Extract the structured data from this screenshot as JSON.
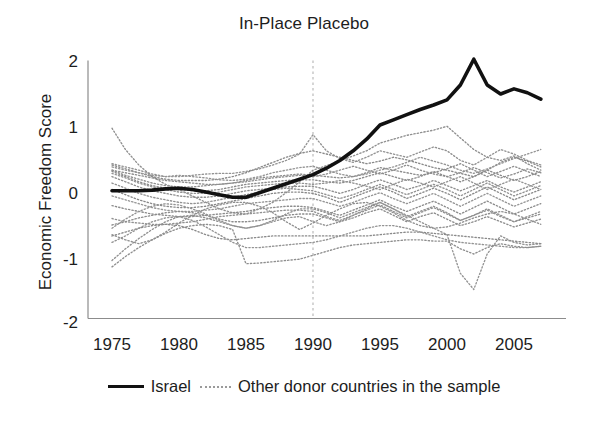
{
  "figure": {
    "title": "In-Place Placebo",
    "background": "#ffffff",
    "width": 608,
    "height": 425
  },
  "axes": {
    "ylabel": "Economic Freedom Score",
    "xlabel": "",
    "yticks": [
      "2",
      "1",
      "0",
      "-1",
      "-2"
    ],
    "xticks": [
      "1975",
      "1980",
      "1985",
      "1990",
      "1995",
      "2000",
      "2005"
    ],
    "axis_color": "#8c8c8c"
  },
  "legend": {
    "items": [
      {
        "label": "Israel",
        "style": "solid",
        "color": "#111111",
        "icon": "solid-line-icon"
      },
      {
        "label": "Other donor countries in the sample",
        "style": "dotted",
        "color": "#9a9a9a",
        "icon": "dotted-line-icon"
      }
    ]
  },
  "annotations": {
    "treatment_year_line": {
      "name": "treatment-year-marker",
      "x": 1990,
      "style": "dashed",
      "color": "#b4b4b4"
    }
  },
  "chart_data": {
    "type": "line",
    "title": "In-Place Placebo",
    "xlabel": "",
    "ylabel": "Economic Freedom Score",
    "xlim": [
      1975,
      2007
    ],
    "ylim": [
      -2,
      2
    ],
    "xticks": [
      1975,
      1980,
      1985,
      1990,
      1995,
      2000,
      2005
    ],
    "yticks": [
      -2,
      -1,
      0,
      1,
      2
    ],
    "grid": false,
    "legend_position": "below-axis",
    "vline_x": 1990,
    "x": [
      1975,
      1976,
      1977,
      1978,
      1979,
      1980,
      1981,
      1982,
      1983,
      1984,
      1985,
      1986,
      1987,
      1988,
      1989,
      1990,
      1991,
      1992,
      1993,
      1994,
      1995,
      1996,
      1997,
      1998,
      1999,
      2000,
      2001,
      2002,
      2003,
      2004,
      2005,
      2006,
      2007
    ],
    "series": [
      {
        "name": "Israel",
        "style": "solid",
        "color": "#111111",
        "width": 3.6,
        "values": [
          -0.02,
          -0.02,
          -0.02,
          -0.01,
          0.01,
          0.02,
          0.0,
          -0.04,
          -0.08,
          -0.12,
          -0.12,
          -0.05,
          0.02,
          0.09,
          0.16,
          0.23,
          0.33,
          0.45,
          0.6,
          0.78,
          1.0,
          1.08,
          1.16,
          1.24,
          1.31,
          1.39,
          1.62,
          2.02,
          1.62,
          1.48,
          1.56,
          1.5,
          1.4
        ]
      },
      {
        "name": "donor-1",
        "style": "dotted",
        "color": "#8f8f8f",
        "values": [
          0.95,
          0.62,
          0.38,
          0.2,
          0.08,
          0.0,
          -0.1,
          -0.2,
          -0.3,
          -0.36,
          -0.38,
          -0.3,
          -0.2,
          -0.05,
          0.12,
          0.3,
          0.37,
          0.45,
          0.52,
          0.6,
          0.72,
          0.78,
          0.84,
          0.88,
          0.92,
          0.98,
          0.8,
          0.62,
          0.5,
          0.45,
          0.52,
          0.4,
          0.3
        ]
      },
      {
        "name": "donor-2",
        "style": "dotted",
        "color": "#939393",
        "values": [
          0.4,
          0.35,
          0.3,
          0.24,
          0.2,
          0.2,
          0.22,
          0.24,
          0.25,
          0.25,
          0.28,
          0.32,
          0.38,
          0.45,
          0.55,
          0.85,
          0.6,
          0.48,
          0.42,
          0.5,
          0.6,
          0.55,
          0.5,
          0.58,
          0.66,
          0.6,
          0.45,
          0.38,
          0.5,
          0.62,
          0.55,
          0.45,
          0.38
        ]
      },
      {
        "name": "donor-3",
        "style": "dotted",
        "color": "#8a8a8a",
        "values": [
          0.38,
          0.32,
          0.26,
          0.2,
          0.16,
          0.14,
          0.14,
          0.14,
          0.16,
          0.2,
          0.26,
          0.34,
          0.42,
          0.5,
          0.56,
          0.6,
          0.55,
          0.5,
          0.45,
          0.4,
          0.44,
          0.5,
          0.46,
          0.4,
          0.34,
          0.3,
          0.25,
          0.2,
          0.3,
          0.42,
          0.5,
          0.44,
          0.35
        ]
      },
      {
        "name": "donor-4",
        "style": "dotted",
        "color": "#959595",
        "values": [
          0.35,
          0.3,
          0.26,
          0.22,
          0.2,
          0.22,
          0.2,
          0.18,
          0.15,
          0.14,
          0.16,
          0.2,
          0.26,
          0.3,
          0.34,
          0.36,
          0.3,
          0.24,
          0.2,
          0.24,
          0.3,
          0.35,
          0.42,
          0.5,
          0.44,
          0.38,
          0.3,
          0.25,
          0.32,
          0.4,
          0.48,
          0.55,
          0.62
        ]
      },
      {
        "name": "donor-5",
        "style": "dotted",
        "color": "#8d8d8d",
        "values": [
          0.3,
          0.26,
          0.22,
          0.18,
          0.14,
          0.12,
          0.1,
          0.08,
          0.08,
          0.1,
          0.14,
          0.18,
          0.2,
          0.22,
          0.24,
          0.22,
          0.2,
          0.18,
          0.2,
          0.26,
          0.34,
          0.3,
          0.26,
          0.22,
          0.26,
          0.32,
          0.4,
          0.3,
          0.2,
          0.28,
          0.36,
          0.28,
          0.2
        ]
      },
      {
        "name": "donor-6",
        "style": "dotted",
        "color": "#909090",
        "values": [
          0.3,
          0.22,
          0.16,
          0.1,
          0.06,
          0.04,
          0.04,
          0.06,
          0.08,
          0.1,
          0.12,
          0.15,
          0.18,
          0.2,
          0.22,
          0.2,
          0.24,
          0.3,
          0.36,
          0.3,
          0.24,
          0.3,
          0.38,
          0.3,
          0.24,
          0.2,
          0.26,
          0.34,
          0.26,
          0.18,
          0.24,
          0.32,
          0.26
        ]
      },
      {
        "name": "donor-7",
        "style": "dotted",
        "color": "#8b8b8b",
        "values": [
          0.28,
          0.2,
          0.12,
          0.06,
          0.02,
          0.0,
          -0.02,
          -0.02,
          0.0,
          0.04,
          0.08,
          0.1,
          0.12,
          0.14,
          0.15,
          0.15,
          0.12,
          0.1,
          0.14,
          0.2,
          0.26,
          0.2,
          0.14,
          0.2,
          0.28,
          0.2,
          0.12,
          0.2,
          0.3,
          0.22,
          0.14,
          0.2,
          0.28
        ]
      },
      {
        "name": "donor-8",
        "style": "dotted",
        "color": "#949494",
        "values": [
          0.25,
          0.18,
          0.1,
          0.04,
          0.0,
          -0.04,
          -0.06,
          -0.06,
          -0.04,
          0.0,
          0.04,
          0.06,
          0.08,
          0.1,
          0.1,
          0.08,
          0.1,
          0.14,
          0.1,
          0.05,
          0.0,
          0.08,
          0.16,
          0.1,
          0.04,
          0.12,
          0.2,
          0.1,
          0.0,
          0.08,
          0.16,
          0.08,
          0.0
        ]
      },
      {
        "name": "donor-9",
        "style": "dotted",
        "color": "#8e8e8e",
        "values": [
          0.2,
          0.12,
          0.04,
          -0.02,
          -0.06,
          -0.1,
          -0.12,
          -0.12,
          -0.1,
          -0.06,
          -0.02,
          0.0,
          0.02,
          0.04,
          0.05,
          0.05,
          0.0,
          -0.06,
          0.0,
          0.08,
          0.15,
          0.08,
          0.0,
          0.06,
          0.14,
          0.06,
          -0.02,
          0.06,
          0.14,
          0.04,
          -0.04,
          0.04,
          0.12
        ]
      },
      {
        "name": "donor-10",
        "style": "dotted",
        "color": "#929292",
        "values": [
          0.1,
          0.02,
          -0.06,
          -0.12,
          -0.16,
          -0.2,
          -0.22,
          -0.2,
          -0.16,
          -0.12,
          -0.08,
          -0.04,
          0.0,
          0.02,
          0.0,
          -0.02,
          -0.08,
          -0.14,
          -0.08,
          0.0,
          0.08,
          0.0,
          -0.08,
          0.0,
          0.08,
          0.0,
          -0.1,
          0.0,
          0.1,
          0.0,
          -0.1,
          -0.02,
          0.06
        ]
      },
      {
        "name": "donor-11",
        "style": "dotted",
        "color": "#898989",
        "values": [
          0.0,
          -0.08,
          -0.16,
          -0.22,
          -0.26,
          -0.28,
          -0.28,
          -0.26,
          -0.22,
          -0.18,
          -0.14,
          -0.1,
          -0.06,
          -0.04,
          -0.04,
          -0.06,
          -0.12,
          -0.2,
          -0.12,
          -0.04,
          0.04,
          -0.04,
          -0.14,
          -0.06,
          0.02,
          -0.06,
          -0.16,
          -0.06,
          0.04,
          -0.06,
          -0.16,
          -0.08,
          0.0
        ]
      },
      {
        "name": "donor-12",
        "style": "dotted",
        "color": "#969696",
        "values": [
          -0.1,
          -0.16,
          -0.22,
          -0.28,
          -0.32,
          -0.34,
          -0.34,
          -0.32,
          -0.3,
          -0.26,
          -0.22,
          -0.2,
          -0.18,
          -0.16,
          -0.14,
          -0.14,
          -0.2,
          -0.26,
          -0.2,
          -0.12,
          -0.05,
          -0.14,
          -0.22,
          -0.14,
          -0.06,
          -0.16,
          -0.26,
          -0.16,
          -0.06,
          -0.16,
          -0.26,
          -0.18,
          -0.1
        ]
      },
      {
        "name": "donor-13",
        "style": "dotted",
        "color": "#8c8c8c",
        "values": [
          -0.25,
          -0.3,
          -0.34,
          -0.38,
          -0.4,
          -0.42,
          -0.42,
          -0.4,
          -0.38,
          -0.36,
          -0.34,
          -0.3,
          -0.28,
          -0.26,
          -0.26,
          -0.28,
          -0.34,
          -0.4,
          -0.32,
          -0.24,
          -0.16,
          -0.26,
          -0.34,
          -0.26,
          -0.18,
          -0.28,
          -0.38,
          -0.28,
          -0.18,
          -0.28,
          -0.38,
          -0.3,
          -0.22
        ]
      },
      {
        "name": "donor-14",
        "style": "dotted",
        "color": "#919191",
        "values": [
          -0.45,
          -0.5,
          -0.52,
          -0.54,
          -0.54,
          -0.52,
          -0.5,
          -0.46,
          -0.42,
          -0.4,
          -0.38,
          -0.36,
          -0.34,
          -0.32,
          -0.32,
          -0.34,
          -0.42,
          -0.48,
          -0.4,
          -0.32,
          -0.24,
          -0.34,
          -0.44,
          -0.36,
          -0.28,
          -0.38,
          -0.48,
          -0.4,
          -0.32,
          -0.42,
          -0.5,
          -0.44,
          -0.38
        ]
      },
      {
        "name": "donor-15",
        "style": "dotted",
        "color": "#8d8d8d",
        "values": [
          -0.55,
          -0.5,
          -0.44,
          -0.4,
          -0.36,
          -0.34,
          -0.36,
          -0.4,
          -0.46,
          -0.5,
          -0.5,
          -0.48,
          -0.44,
          -0.4,
          -0.38,
          -0.38,
          -0.44,
          -0.5,
          -0.44,
          -0.36,
          -0.3,
          -0.4,
          -0.5,
          -0.42,
          -0.36,
          -0.46,
          -0.56,
          -0.5,
          -0.42,
          -0.5,
          -0.58,
          -0.52,
          -0.46
        ]
      },
      {
        "name": "donor-16",
        "style": "dotted",
        "color": "#949494",
        "values": [
          -0.6,
          -0.46,
          -0.34,
          -0.26,
          -0.22,
          -0.24,
          -0.3,
          -0.38,
          -0.48,
          -0.56,
          -0.6,
          -0.56,
          -0.5,
          -0.44,
          -0.42,
          -0.5,
          -0.56,
          -0.5,
          -0.4,
          -0.3,
          -0.2,
          -0.3,
          -0.4,
          -0.5,
          -0.6,
          -0.7,
          -1.3,
          -1.55,
          -1.0,
          -0.72,
          -0.82,
          -0.86,
          -0.84
        ]
      },
      {
        "name": "donor-17",
        "style": "dotted",
        "color": "#8f8f8f",
        "values": [
          -0.7,
          -0.78,
          -0.84,
          -0.78,
          -0.66,
          -0.52,
          -0.4,
          -0.3,
          -0.24,
          -0.2,
          -0.2,
          -0.26,
          -0.36,
          -0.5,
          -0.62,
          -0.52,
          -0.4,
          -0.3,
          -0.22,
          -0.2,
          -0.26,
          -0.36,
          -0.48,
          -0.56,
          -0.6,
          -0.58,
          -0.52,
          -0.44,
          -0.38,
          -0.34,
          -0.38,
          -0.46,
          -0.54
        ]
      },
      {
        "name": "donor-18",
        "style": "dotted",
        "color": "#8a8a8a",
        "values": [
          -0.72,
          -0.66,
          -0.6,
          -0.56,
          -0.54,
          -0.56,
          -0.62,
          -0.7,
          -0.76,
          -0.78,
          -0.76,
          -0.74,
          -0.72,
          -0.72,
          -0.72,
          -0.72,
          -0.72,
          -0.72,
          -0.72,
          -0.72,
          -0.7,
          -0.68,
          -0.66,
          -0.66,
          -0.68,
          -0.7,
          -0.72,
          -0.74,
          -0.76,
          -0.78,
          -0.8,
          -0.82,
          -0.84
        ]
      },
      {
        "name": "donor-19",
        "style": "dotted",
        "color": "#939393",
        "values": [
          -0.82,
          -0.72,
          -0.6,
          -0.5,
          -0.44,
          -0.42,
          -0.48,
          -0.58,
          -0.7,
          -0.82,
          -0.9,
          -0.9,
          -0.88,
          -0.86,
          -0.84,
          -0.82,
          -0.78,
          -0.72,
          -0.66,
          -0.6,
          -0.56,
          -0.56,
          -0.6,
          -0.66,
          -0.72,
          -0.78,
          -0.82,
          -0.84,
          -0.86,
          -0.88,
          -0.9,
          -0.9,
          -0.88
        ]
      },
      {
        "name": "donor-20",
        "style": "dotted",
        "color": "#8e8e8e",
        "values": [
          -1.2,
          -1.04,
          -0.9,
          -0.78,
          -0.68,
          -0.6,
          -0.56,
          -0.54,
          -0.56,
          -0.62,
          -1.15,
          -1.14,
          -1.12,
          -1.1,
          -1.08,
          -1.02,
          -0.96,
          -0.9,
          -0.86,
          -0.84,
          -0.82,
          -0.8,
          -0.78,
          -0.78,
          -0.8,
          -0.8,
          -0.92,
          -1.0,
          -0.9,
          -0.84,
          -0.88,
          -0.9,
          -0.88
        ]
      },
      {
        "name": "donor-21",
        "style": "dotted",
        "color": "#909090",
        "values": [
          -1.1,
          -0.92,
          -0.76,
          -0.62,
          -0.5,
          -0.42,
          -0.4,
          -0.44,
          -0.5,
          -0.56,
          -0.6,
          -0.56,
          -0.48,
          -0.38,
          -0.3,
          -0.3,
          -0.36,
          -0.44,
          -0.36,
          -0.28,
          -0.2,
          -0.3,
          -0.42,
          -0.34,
          -0.26,
          -0.36,
          -0.48,
          -0.4,
          -0.3,
          -0.4,
          -0.5,
          -0.42,
          -0.34
        ]
      }
    ]
  }
}
